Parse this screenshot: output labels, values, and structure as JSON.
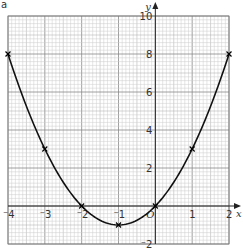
{
  "figure_label": "a",
  "chart_data": {
    "type": "line",
    "title": "",
    "xlabel": "x",
    "ylabel": "y",
    "xlim": [
      -4,
      2
    ],
    "ylim": [
      -2,
      10
    ],
    "grid": true,
    "x_ticks": [
      "-4",
      "-3",
      "-2",
      "-1",
      "0",
      "1",
      "2"
    ],
    "y_ticks": [
      "-2",
      "2",
      "4",
      "6",
      "8",
      "10"
    ],
    "origin_label": "O",
    "series": [
      {
        "name": "y = x² + 2x",
        "x": [
          -4,
          -3,
          -2,
          -1,
          0,
          1,
          2
        ],
        "y": [
          8,
          3,
          0,
          -1,
          0,
          3,
          8
        ],
        "marker": "x",
        "curve": "smooth"
      }
    ]
  }
}
